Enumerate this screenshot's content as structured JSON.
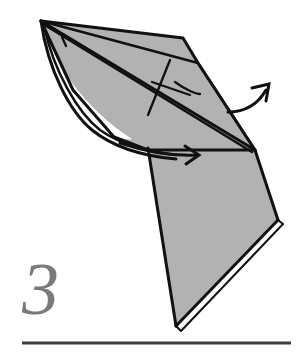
{
  "page": {
    "kind": "origami-instruction-diagram",
    "width": 307,
    "height": 360,
    "background_color": "#ffffff"
  },
  "step": {
    "number_label": "3",
    "number_color": "#7a7a7a"
  },
  "rule": {
    "color": "#3c3c3c",
    "x_start": 22,
    "x_end": 291,
    "y": 343,
    "thickness": 3
  },
  "figure": {
    "name": "folded-paper-model",
    "fill_color": "#b2b2b2",
    "stroke_color": "#111111",
    "white_gap_color": "#ffffff",
    "parts": [
      {
        "name": "upper-wing-panel",
        "description": "large shaded quadrilateral sweeping from top-left apex to right vertex"
      },
      {
        "name": "lower-body-panel",
        "description": "shaded triangular body descending to bottom point"
      },
      {
        "name": "inner-flap-sliver",
        "description": "thin white lifted flap along lower-left edge"
      },
      {
        "name": "right-edge-sliver",
        "description": "thin white sliver along lower-right edge"
      },
      {
        "name": "crease-lines",
        "description": "internal valley and mountain crease lines"
      }
    ]
  },
  "annotations": {
    "arrows": [
      {
        "name": "fold-arrow-upper-right",
        "icon": "curved-arrow-open-head",
        "direction": "up-right",
        "description": "curved motion arrow leaving the right vertex pointing up and to the right"
      },
      {
        "name": "fold-arrow-middle-right",
        "icon": "curved-arrow-open-head",
        "direction": "right",
        "description": "curved motion arrow along the lower sweep pointing right"
      }
    ],
    "motion_arc": {
      "name": "fold-sweep-arc",
      "description": "long curved arc from the top-left apex sweeping down the left side and across to the right"
    }
  },
  "colors": {
    "paper_gray": "#b2b2b2",
    "ink_black": "#111111",
    "rule_gray": "#3c3c3c",
    "numeral_gray": "#7a7a7a",
    "paper_white": "#ffffff"
  }
}
